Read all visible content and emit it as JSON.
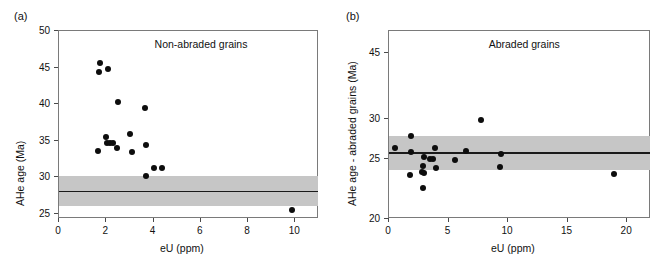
{
  "figure": {
    "panels": [
      {
        "letter": "(a)",
        "title": "Non-abraded grains",
        "xlabel": "eU (ppm)",
        "ylabel": "AHe age (Ma)",
        "xticks": [
          "0",
          "2",
          "4",
          "6",
          "8",
          "10"
        ],
        "yticks": [
          "25",
          "30",
          "35",
          "40",
          "45",
          "50"
        ]
      },
      {
        "letter": "(b)",
        "title": "Abraded grains",
        "xlabel": "eU (ppm)",
        "ylabel": "AHe age - abraded grains (Ma)",
        "xticks": [
          "0",
          "5",
          "10",
          "15",
          "20"
        ],
        "yticks": [
          "20",
          "25",
          "30",
          "45"
        ]
      }
    ]
  },
  "chart_data": [
    {
      "type": "scatter",
      "panel": "a",
      "title": "Non-abraded grains",
      "xlabel": "eU (ppm)",
      "ylabel": "AHe age (Ma)",
      "xlim": [
        0,
        11
      ],
      "ylim": [
        24.3,
        50
      ],
      "xticks": [
        0,
        2,
        4,
        6,
        8,
        10
      ],
      "yticks": [
        25,
        30,
        35,
        40,
        45,
        50
      ],
      "grid": false,
      "legend": false,
      "marker": "filled-circle",
      "marker_color": "#0d0d0d",
      "points": [
        {
          "x": 1.78,
          "y": 45.5
        },
        {
          "x": 1.72,
          "y": 44.3
        },
        {
          "x": 2.13,
          "y": 44.7
        },
        {
          "x": 2.55,
          "y": 40.2
        },
        {
          "x": 3.68,
          "y": 39.3
        },
        {
          "x": 2.03,
          "y": 35.4
        },
        {
          "x": 3.05,
          "y": 35.8
        },
        {
          "x": 2.08,
          "y": 34.6
        },
        {
          "x": 2.18,
          "y": 34.5
        },
        {
          "x": 2.32,
          "y": 34.5
        },
        {
          "x": 3.72,
          "y": 34.3
        },
        {
          "x": 2.5,
          "y": 33.9
        },
        {
          "x": 1.7,
          "y": 33.5
        },
        {
          "x": 3.12,
          "y": 33.3
        },
        {
          "x": 4.08,
          "y": 31.2
        },
        {
          "x": 4.42,
          "y": 31.2
        },
        {
          "x": 3.72,
          "y": 30.05
        },
        {
          "x": 9.9,
          "y": 25.4
        }
      ],
      "band": {
        "label": "reference age band",
        "y_low": 26.0,
        "y_high": 30.0,
        "color": "#c6c6c6"
      },
      "mean_line": {
        "y": 28.0,
        "color": "#1a1a1a"
      }
    },
    {
      "type": "scatter",
      "panel": "b",
      "title": "Abraded grains",
      "xlabel": "eU (ppm)",
      "ylabel": "AHe age - abraded grains (Ma)",
      "xlim": [
        0,
        22
      ],
      "ylim": [
        20,
        47.5
      ],
      "xticks": [
        0,
        5,
        10,
        15,
        20
      ],
      "yticks": [
        20,
        25,
        30,
        45
      ],
      "y_axis_nonlinear": true,
      "grid": false,
      "legend": false,
      "marker": "filled-circle",
      "marker_color": "#0d0d0d",
      "points": [
        {
          "x": 7.8,
          "y": 29.7
        },
        {
          "x": 1.95,
          "y": 27.75
        },
        {
          "x": 0.6,
          "y": 26.3
        },
        {
          "x": 1.9,
          "y": 25.75
        },
        {
          "x": 3.95,
          "y": 26.2
        },
        {
          "x": 6.55,
          "y": 25.9
        },
        {
          "x": 9.45,
          "y": 25.5
        },
        {
          "x": 3.05,
          "y": 25.15
        },
        {
          "x": 3.55,
          "y": 24.95
        },
        {
          "x": 3.8,
          "y": 24.95
        },
        {
          "x": 5.6,
          "y": 24.85
        },
        {
          "x": 2.95,
          "y": 24.3
        },
        {
          "x": 4.05,
          "y": 24.2
        },
        {
          "x": 9.4,
          "y": 24.25
        },
        {
          "x": 2.85,
          "y": 23.8
        },
        {
          "x": 3.05,
          "y": 23.75
        },
        {
          "x": 1.85,
          "y": 23.55
        },
        {
          "x": 19.0,
          "y": 23.7
        },
        {
          "x": 2.95,
          "y": 22.5
        }
      ],
      "band": {
        "label": "reference age band",
        "y_low": 24.0,
        "y_high": 27.8,
        "color": "#c6c6c6"
      },
      "mean_line": {
        "y": 25.7,
        "color": "#1a1a1a"
      }
    }
  ]
}
